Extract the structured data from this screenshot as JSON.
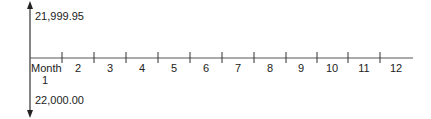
{
  "diagram": {
    "type": "timeline",
    "y_axis": {
      "top_label": "21,999.95",
      "bottom_label": "22,000.00"
    },
    "x_axis": {
      "start_label": "Month",
      "start_sublabel": "1",
      "months": [
        "2",
        "3",
        "4",
        "5",
        "6",
        "7",
        "8",
        "9",
        "10",
        "11",
        "12"
      ]
    },
    "colors": {
      "line": "#333333",
      "text": "#222222"
    }
  }
}
